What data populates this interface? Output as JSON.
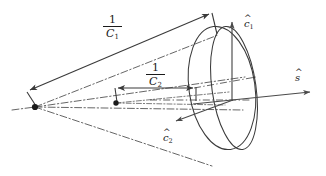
{
  "figure": {
    "width": 326,
    "height": 176,
    "background_color": "#ffffff",
    "stroke_color": "#3a3a3a",
    "dash_color": "#4a4a4a",
    "labels": {
      "radius_major": {
        "numerator": "1",
        "denominator": "C",
        "subscript": "1",
        "text": "1/C1",
        "x": 115,
        "y": 28
      },
      "radius_minor": {
        "numerator": "1",
        "denominator": "C",
        "subscript": "2",
        "text": "1/C2",
        "x": 157,
        "y": 76
      },
      "vector_c1": {
        "symbol": "c",
        "subscript": "1",
        "accent": "hat",
        "text": "c1-hat",
        "x": 244,
        "y": 14
      },
      "vector_c2": {
        "symbol": "c",
        "subscript": "2",
        "accent": "hat",
        "text": "c2-hat",
        "x": 163,
        "y": 128
      },
      "vector_s": {
        "symbol": "s",
        "subscript": "",
        "accent": "hat",
        "text": "s-hat",
        "x": 295,
        "y": 68
      }
    },
    "geometry": {
      "apex_point": {
        "x": 35,
        "y": 107
      },
      "inner_point": {
        "x": 116,
        "y": 103
      },
      "ellipse_outer": {
        "cx": 222,
        "cy": 88,
        "rx": 33,
        "ry": 62,
        "rotation": -8
      },
      "ellipse_inner": {
        "cx": 234,
        "cy": 88,
        "rx": 22,
        "ry": 62,
        "rotation": -8
      },
      "arrow_major_from": {
        "x": 27,
        "y": 92
      },
      "arrow_major_to": {
        "x": 212,
        "y": 13
      },
      "arrow_minor_from": {
        "x": 114,
        "y": 88
      },
      "arrow_minor_to": {
        "x": 196,
        "y": 87
      },
      "arrow_c1_from": {
        "x": 232,
        "y": 100
      },
      "arrow_c1_to": {
        "x": 232,
        "y": 19
      },
      "arrow_c2_from": {
        "x": 232,
        "y": 100
      },
      "arrow_c2_to": {
        "x": 173,
        "y": 122
      },
      "arrow_s_from": {
        "x": 193,
        "y": 103
      },
      "arrow_s_to": {
        "x": 314,
        "y": 92
      }
    }
  }
}
